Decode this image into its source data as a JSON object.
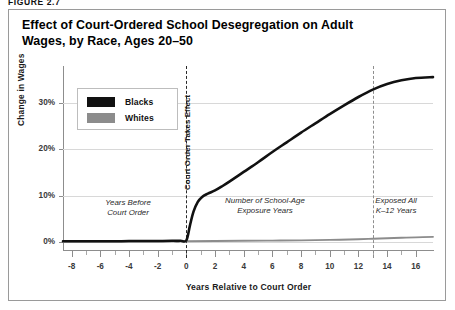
{
  "figure": {
    "label": "FIGURE 2.7"
  },
  "title": "Effect of Court-Ordered School Desegregation on Adult Wages, by Race, Ages 20–50",
  "legend": {
    "items": [
      {
        "label": "Blacks",
        "color": "#111111"
      },
      {
        "label": "Whites",
        "color": "#8c8c8c"
      }
    ]
  },
  "annotations": [
    {
      "name": "years-before-court-order",
      "text": "Years Before\nCourt Order"
    },
    {
      "name": "school-age-exposure-years",
      "text": "Number of School-Age\nExposure Years"
    },
    {
      "name": "exposed-all-k12-years",
      "text": "Exposed All\nK–12 Years"
    }
  ],
  "vertical_lines": [
    {
      "name": "court-order-line",
      "x": 0,
      "label": "Court Order Takes Effect"
    },
    {
      "name": "full-exposure-line",
      "x": 13,
      "label": ""
    }
  ],
  "chart_data": {
    "type": "line",
    "title": "Effect of Court-Ordered School Desegregation on Adult Wages, by Race, Ages 20–50",
    "xlabel": "Years Relative to Court Order",
    "ylabel": "Change in Wages",
    "xlim": [
      -8.6,
      17.2
    ],
    "ylim": [
      -2,
      38
    ],
    "grid": true,
    "legend_position": "upper-left-inside",
    "xticks": [
      -8,
      -6,
      -4,
      -2,
      0,
      2,
      4,
      6,
      8,
      10,
      12,
      14,
      16
    ],
    "xtick_labels": [
      "-8",
      "-6",
      "-4",
      "-2",
      "0",
      "2",
      "4",
      "6",
      "8",
      "10",
      "12",
      "14",
      "16"
    ],
    "xticks_minor": [
      -7,
      -5,
      -3,
      -1,
      1,
      3,
      5,
      7,
      9,
      11,
      13,
      15
    ],
    "yticks": [
      0,
      10,
      20,
      30
    ],
    "ytick_labels": [
      "0%",
      "10%",
      "20%",
      "30%"
    ],
    "series": [
      {
        "name": "Blacks",
        "color": "#111111",
        "x": [
          -8.6,
          -8,
          -7,
          -6,
          -5,
          -4,
          -3,
          -2,
          -1,
          -0.4,
          0,
          0.25,
          0.5,
          0.8,
          1.1,
          1.5,
          2,
          2.5,
          3,
          4,
          5,
          6,
          7,
          8,
          9,
          10,
          11,
          12,
          13,
          14,
          15,
          16,
          17.2
        ],
        "y": [
          0.1,
          0.1,
          0.1,
          0.1,
          0.1,
          0.15,
          0.15,
          0.15,
          0.2,
          0.2,
          0.3,
          3.5,
          6.5,
          8.6,
          9.7,
          10.4,
          11.1,
          12.0,
          13.0,
          15.1,
          17.2,
          19.4,
          21.5,
          23.6,
          25.6,
          27.6,
          29.5,
          31.3,
          32.9,
          34.1,
          34.9,
          35.4,
          35.6
        ]
      },
      {
        "name": "Whites",
        "color": "#8c8c8c",
        "x": [
          -8.6,
          -8,
          -6,
          -4,
          -2,
          0,
          2,
          4,
          6,
          8,
          10,
          12,
          13,
          14,
          15,
          16,
          17.2
        ],
        "y": [
          0.05,
          0.05,
          0.05,
          0.05,
          0.05,
          0.1,
          0.15,
          0.2,
          0.25,
          0.3,
          0.4,
          0.55,
          0.65,
          0.75,
          0.85,
          0.95,
          1.05
        ]
      }
    ]
  }
}
